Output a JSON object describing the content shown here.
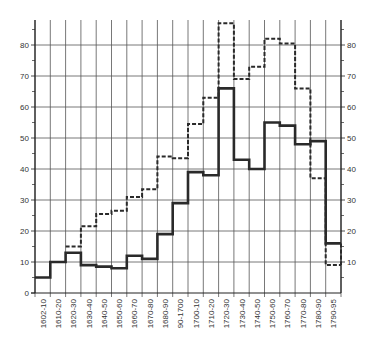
{
  "chart_data": {
    "type": "line",
    "subtype": "step",
    "title": "",
    "xlabel": "",
    "ylabel": "",
    "ylim": [
      0,
      88
    ],
    "yticks": [
      0,
      10,
      20,
      30,
      40,
      50,
      60,
      70,
      80
    ],
    "yticks_right": [
      10,
      20,
      30,
      40,
      50,
      60,
      70,
      80
    ],
    "grid": true,
    "legend": null,
    "categories": [
      "1602-10",
      "1610-20",
      "1620-30",
      "1630-40",
      "1640-50",
      "1650-60",
      "1660-70",
      "1670-80",
      "1680-90",
      "90-1700",
      "1700-10",
      "1710-20",
      "1720-30",
      "1730-40",
      "1740-50",
      "1750-60",
      "1760-70",
      "1770-80",
      "1780-90",
      "1790-95"
    ],
    "series": [
      {
        "name": "solid",
        "style": "solid",
        "values": [
          5,
          10,
          13,
          9,
          8.5,
          8,
          12,
          11,
          19,
          29,
          39,
          38,
          66,
          43,
          40,
          55,
          54,
          48,
          49,
          16
        ]
      },
      {
        "name": "dashed",
        "style": "dashed",
        "values": [
          null,
          null,
          15,
          21.5,
          25.5,
          26.5,
          31,
          33.5,
          44,
          43.5,
          54.5,
          63,
          87,
          69,
          73,
          82,
          80.5,
          66,
          37,
          9
        ]
      }
    ]
  }
}
